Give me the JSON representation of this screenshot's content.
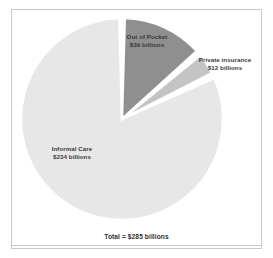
{
  "chart_data": {
    "type": "pie",
    "title": "",
    "subtitle": "",
    "xlabel": "",
    "ylabel": "",
    "unit": "billions",
    "currency": "$",
    "total_label": "Total = $285 billions",
    "total_value": 285,
    "legend_position": "none",
    "grid": false,
    "start_angle_deg": 0,
    "direction": "clockwise",
    "categories": [
      "Out of Pocket",
      "Private insurance",
      "Informal Care"
    ],
    "values": [
      39,
      12,
      234
    ],
    "value_labels": [
      "$39 billions",
      "$12 billions",
      "$234 billions"
    ],
    "colors": [
      "#8f8f8f",
      "#c4c4c4",
      "#e7e7e7"
    ],
    "slices": [
      {
        "name": "Out of Pocket",
        "value": 39,
        "value_label": "$39 billions",
        "percent": 13.7,
        "color": "#8f8f8f",
        "start_deg": 0,
        "end_deg": 49.3
      },
      {
        "name": "Private insurance",
        "value": 12,
        "value_label": "$12 billions",
        "percent": 4.2,
        "color": "#c4c4c4",
        "start_deg": 49.3,
        "end_deg": 64.5
      },
      {
        "name": "Informal Care",
        "value": 234,
        "value_label": "$234 billions",
        "percent": 82.1,
        "color": "#e7e7e7",
        "start_deg": 64.5,
        "end_deg": 360
      }
    ]
  },
  "labels": {
    "out_of_pocket": {
      "name": "Out of Pocket",
      "value": "$39 billions"
    },
    "private_insurance": {
      "name": "Private insurance",
      "value": "$12 billions"
    },
    "informal_care": {
      "name": "Informal Care",
      "value": "$234 billions"
    }
  },
  "footer": {
    "total": "Total = $285 billions"
  },
  "style": {
    "border_color": "#c9c9c9",
    "text_color": "#3a3a3a",
    "background": "#ffffff",
    "separator_color": "#ffffff"
  }
}
